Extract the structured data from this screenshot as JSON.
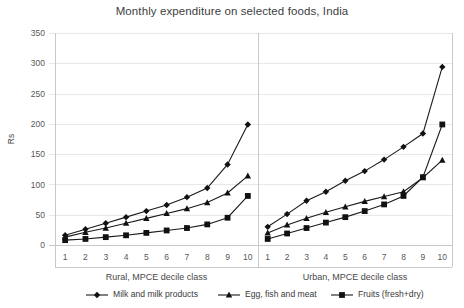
{
  "chart_data": {
    "type": "line",
    "title": "Monthly expenditure on selected foods, India",
    "ylabel": "Rs",
    "ylim": [
      0,
      350
    ],
    "ytick_step": 50,
    "yticks": [
      0,
      50,
      100,
      150,
      200,
      250,
      300,
      350
    ],
    "grid": true,
    "legend_position": "bottom",
    "categories": [
      "1",
      "2",
      "3",
      "4",
      "5",
      "6",
      "7",
      "8",
      "9",
      "10"
    ],
    "panels": [
      {
        "name": "rural",
        "xlabel": "Rural, MPCE decile class",
        "series": [
          {
            "name": "Milk and milk products",
            "marker": "diamond",
            "values": [
              16,
              26,
              36,
              46,
              56,
              66,
              79,
              94,
              133,
              199
            ]
          },
          {
            "name": "Egg, fish and meat",
            "marker": "triangle",
            "values": [
              13,
              21,
              28,
              36,
              44,
              52,
              60,
              70,
              86,
              114
            ]
          },
          {
            "name": "Fruits (fresh+dry)",
            "marker": "square",
            "values": [
              8,
              10,
              13,
              16,
              20,
              24,
              28,
              34,
              45,
              81
            ]
          }
        ]
      },
      {
        "name": "urban",
        "xlabel": "Urban, MPCE decile class",
        "series": [
          {
            "name": "Milk and milk products",
            "marker": "diamond",
            "values": [
              30,
              51,
              73,
              88,
              106,
              122,
              141,
              162,
              184,
              294
            ]
          },
          {
            "name": "Egg, fish and meat",
            "marker": "triangle",
            "values": [
              20,
              33,
              44,
              54,
              63,
              72,
              80,
              88,
              111,
              140
            ]
          },
          {
            "name": "Fruits (fresh+dry)",
            "marker": "square",
            "values": [
              10,
              19,
              28,
              37,
              46,
              56,
              67,
              81,
              112,
              199
            ]
          }
        ]
      }
    ],
    "legend": [
      {
        "label": "Milk and milk products",
        "marker": "diamond"
      },
      {
        "label": "Egg, fish and meat",
        "marker": "triangle"
      },
      {
        "label": "Fruits (fresh+dry)",
        "marker": "square"
      }
    ]
  }
}
